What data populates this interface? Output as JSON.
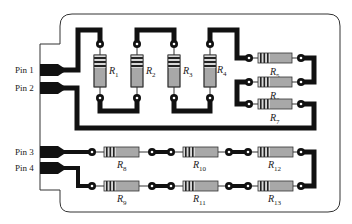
{
  "diagram": {
    "type": "printed-circuit-board",
    "colors": {
      "background": "#ffffff",
      "board_outline": "#333333",
      "trace": "#111111",
      "resistor_body": "#a8a8a8",
      "resistor_band": "#222222",
      "pad_hole": "#ffffff"
    },
    "pins": [
      {
        "id": "pin1",
        "label": "Pin 1"
      },
      {
        "id": "pin2",
        "label": "Pin 2"
      },
      {
        "id": "pin3",
        "label": "Pin 3"
      },
      {
        "id": "pin4",
        "label": "Pin 4"
      }
    ],
    "resistors": [
      {
        "id": "R1",
        "base": "R",
        "sub": "1",
        "orientation": "vertical"
      },
      {
        "id": "R2",
        "base": "R",
        "sub": "2",
        "orientation": "vertical"
      },
      {
        "id": "R3",
        "base": "R",
        "sub": "3",
        "orientation": "vertical"
      },
      {
        "id": "R4",
        "base": "R",
        "sub": "4",
        "orientation": "vertical"
      },
      {
        "id": "R5",
        "base": "R",
        "sub": "5",
        "orientation": "horizontal"
      },
      {
        "id": "R6",
        "base": "R",
        "sub": "6",
        "orientation": "horizontal"
      },
      {
        "id": "R7",
        "base": "R",
        "sub": "7",
        "orientation": "horizontal"
      },
      {
        "id": "R8",
        "base": "R",
        "sub": "8",
        "orientation": "horizontal"
      },
      {
        "id": "R9",
        "base": "R",
        "sub": "9",
        "orientation": "horizontal"
      },
      {
        "id": "R10",
        "base": "R",
        "sub": "10",
        "orientation": "horizontal"
      },
      {
        "id": "R11",
        "base": "R",
        "sub": "11",
        "orientation": "horizontal"
      },
      {
        "id": "R12",
        "base": "R",
        "sub": "12",
        "orientation": "horizontal"
      },
      {
        "id": "R13",
        "base": "R",
        "sub": "13",
        "orientation": "horizontal"
      }
    ]
  }
}
